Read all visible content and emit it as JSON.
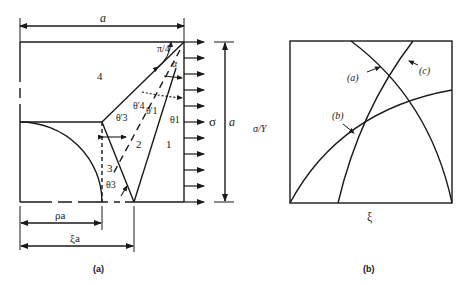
{
  "figure_a": {
    "caption": "(a)",
    "width_label": "a",
    "height_label": "a",
    "stress_label": "σ",
    "angle_label": "π/4",
    "alpha_label": "α",
    "regions": [
      "1",
      "2",
      "3",
      "4"
    ],
    "theta_labels": {
      "theta1": "θ1",
      "theta1_prime": "θ'1",
      "theta3": "θ3",
      "theta3_prime": "θ'3",
      "theta4_prime": "θ'4"
    },
    "dim_rho": "ρa",
    "dim_xi": "ξa"
  },
  "figure_b": {
    "caption": "(b)",
    "ylabel": "σ/Y",
    "xlabel": "ξ",
    "curves": [
      "(a)",
      "(b)",
      "(c)"
    ]
  }
}
